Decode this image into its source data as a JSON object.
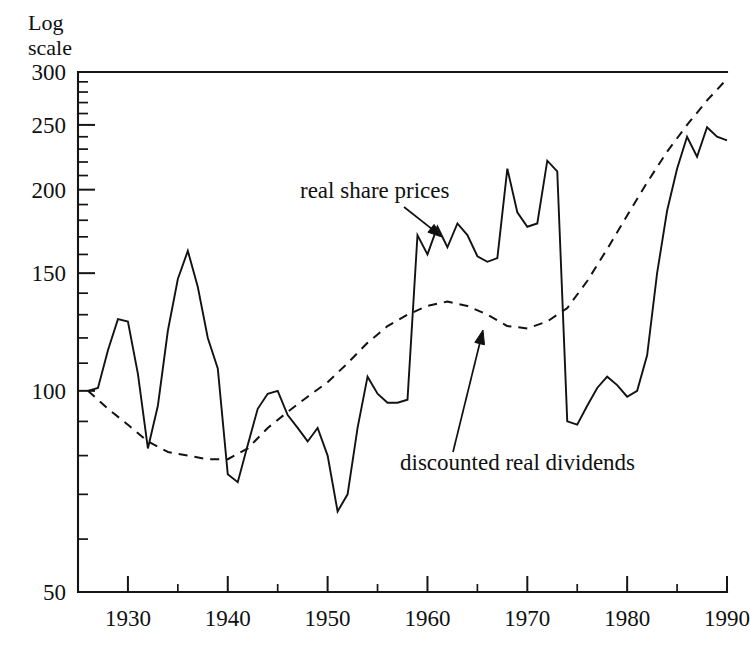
{
  "figure": {
    "axis_caption_line1": "Log",
    "axis_caption_line2": "scale",
    "background_color": "#ffffff",
    "ink_color": "#121212"
  },
  "annotations": [
    {
      "id": "real-share-prices",
      "text": "real share prices",
      "text_x": 300,
      "text_y": 198,
      "arrow_from_x": 404,
      "arrow_from_y": 207,
      "arrow_to_x": 442,
      "arrow_to_y": 237
    },
    {
      "id": "discounted-real-dividends",
      "text": "discounted real dividends",
      "text_x": 400,
      "text_y": 470,
      "arrow_from_x": 453,
      "arrow_from_y": 452,
      "arrow_to_x": 483,
      "arrow_to_y": 330
    }
  ],
  "chart_data": {
    "type": "line",
    "title": "",
    "xlabel": "",
    "ylabel": "Log scale",
    "scale": "log",
    "grid": false,
    "legend": "annotations",
    "xlim": [
      1925,
      1990
    ],
    "ylim": [
      50,
      300
    ],
    "yticks_major": [
      50,
      100,
      150,
      200,
      250,
      300
    ],
    "yticks_minor": [
      60,
      70,
      80,
      90,
      110,
      120,
      130,
      140,
      160,
      170,
      180,
      190,
      210,
      220,
      230,
      240,
      260,
      270,
      280,
      290
    ],
    "xticks_major": [
      1930,
      1940,
      1950,
      1960,
      1970,
      1980,
      1990
    ],
    "xticks_minor": [
      1935,
      1945,
      1955,
      1965,
      1975,
      1985
    ],
    "xtick_labels": [
      "1930",
      "1940",
      "1950",
      "1960",
      "1970",
      "1980",
      "1990"
    ],
    "ytick_labels": [
      "50",
      "100",
      "150",
      "200",
      "250",
      "300"
    ],
    "series": [
      {
        "name": "real share prices",
        "style": "solid",
        "x": [
          1926,
          1927,
          1928,
          1929,
          1930,
          1931,
          1932,
          1933,
          1934,
          1935,
          1936,
          1937,
          1938,
          1939,
          1940,
          1941,
          1942,
          1943,
          1944,
          1945,
          1946,
          1947,
          1948,
          1949,
          1950,
          1951,
          1952,
          1953,
          1954,
          1955,
          1956,
          1957,
          1958,
          1959,
          1960,
          1961,
          1962,
          1963,
          1964,
          1965,
          1966,
          1967,
          1968,
          1969,
          1970,
          1971,
          1972,
          1973,
          1974,
          1975,
          1976,
          1977,
          1978,
          1979,
          1980,
          1981,
          1982,
          1983,
          1984,
          1985,
          1986,
          1987,
          1988,
          1989,
          1990
        ],
        "values": [
          100,
          101,
          115,
          128,
          127,
          106,
          82,
          95,
          123,
          147,
          162,
          143,
          120,
          108,
          75,
          73,
          83,
          94,
          99,
          100,
          92,
          88,
          84,
          88,
          80,
          66,
          70,
          88,
          105,
          99,
          96,
          96,
          97,
          171,
          160,
          176,
          164,
          178,
          171,
          159,
          156,
          158,
          215,
          185,
          176,
          178,
          221,
          213,
          90,
          89,
          95,
          101,
          105,
          102,
          98,
          100,
          113,
          150,
          186,
          215,
          240,
          224,
          248,
          240,
          237
        ]
      },
      {
        "name": "discounted real dividends",
        "style": "dashed",
        "x": [
          1926,
          1928,
          1930,
          1932,
          1934,
          1936,
          1938,
          1940,
          1942,
          1944,
          1946,
          1948,
          1950,
          1952,
          1954,
          1956,
          1958,
          1960,
          1962,
          1964,
          1966,
          1968,
          1970,
          1972,
          1974,
          1976,
          1978,
          1980,
          1982,
          1984,
          1986,
          1988,
          1990
        ],
        "values": [
          100,
          94,
          89,
          84,
          81,
          80,
          79,
          79,
          82,
          88,
          93,
          98,
          103,
          110,
          118,
          125,
          130,
          134,
          136,
          134,
          130,
          125,
          124,
          127,
          133,
          146,
          163,
          183,
          205,
          228,
          250,
          272,
          293
        ]
      }
    ]
  }
}
